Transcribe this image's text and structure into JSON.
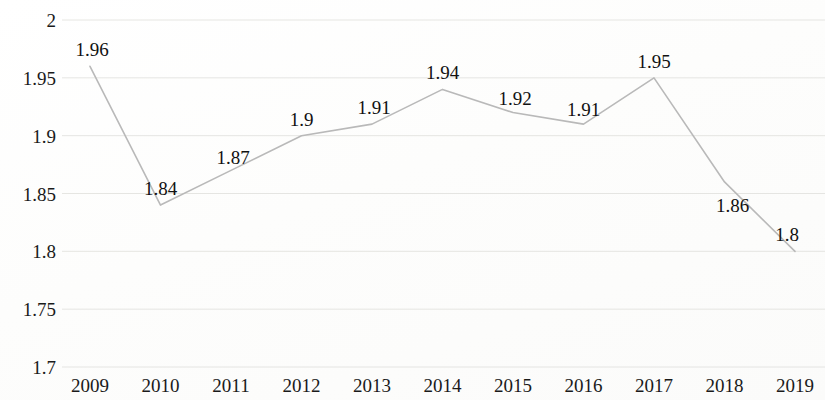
{
  "chart_data": {
    "type": "line",
    "title": "",
    "subtitle": "",
    "xlabel": "",
    "ylabel": "",
    "categories": [
      "2009",
      "2010",
      "2011",
      "2012",
      "2013",
      "2014",
      "2015",
      "2016",
      "2017",
      "2018",
      "2019"
    ],
    "values": [
      1.96,
      1.84,
      1.87,
      1.9,
      1.91,
      1.94,
      1.92,
      1.91,
      1.95,
      1.86,
      1.8
    ],
    "point_labels": [
      "1.96",
      "1.84",
      "1.87",
      "1.9",
      "1.91",
      "1.94",
      "1.92",
      "1.91",
      "1.95",
      "1.86",
      "1.8"
    ],
    "ylim": [
      1.7,
      2.0
    ],
    "ytick_values": [
      2,
      1.95,
      1.9,
      1.85,
      1.8,
      1.75,
      1.7
    ],
    "ytick_labels": [
      "2",
      "1.95",
      "1.9",
      "1.85",
      "1.8",
      "1.75",
      "1.7"
    ],
    "grid": true,
    "grid_axis": "y",
    "legend": false,
    "legend_position": "none",
    "series": [
      {
        "name": "",
        "values": [
          1.96,
          1.84,
          1.87,
          1.9,
          1.91,
          1.94,
          1.92,
          1.91,
          1.95,
          1.86,
          1.8
        ],
        "color": "#b9b9b9",
        "marker": "none",
        "line_width": 1.6
      }
    ],
    "colors": {
      "line": "#b9b9b9",
      "grid": "#dcdcd8",
      "text": "#1a1a1a",
      "background": "#fefefe"
    }
  }
}
